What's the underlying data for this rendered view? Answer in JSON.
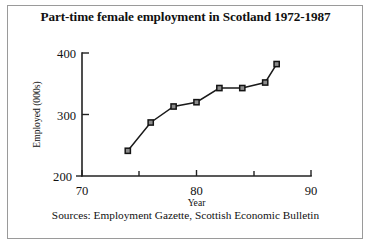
{
  "figure": {
    "title": "Part-time female employment in Scotland 1972-1987",
    "source_note": "Sources: Employment Gazette, Scottish Economic Bulletin",
    "border_color": "#9a9a9a",
    "background": "#ffffff"
  },
  "chart_data": {
    "type": "line",
    "title": "Part-time female employment in Scotland 1972-1987",
    "xlabel": "Year",
    "ylabel": "Employed (000s)",
    "xlim": [
      70,
      90
    ],
    "ylim": [
      200,
      400
    ],
    "xticks": [
      70,
      80,
      90
    ],
    "xtick_labels": [
      "70",
      "80",
      "90"
    ],
    "xminorticks": [
      75,
      80,
      85
    ],
    "yticks": [
      200,
      300,
      400
    ],
    "ytick_labels": [
      "200",
      "300",
      "400"
    ],
    "grid": false,
    "legend": null,
    "marker": "square",
    "line_color": "#1a1a1a",
    "marker_fill": "#8c8c8c",
    "marker_edge": "#141414",
    "x": [
      74,
      76,
      78,
      80,
      82,
      84,
      86,
      87
    ],
    "values": [
      241,
      287,
      313,
      320,
      343,
      343,
      352,
      382
    ],
    "series": [
      {
        "name": "Part-time female employment",
        "x": [
          74,
          76,
          78,
          80,
          82,
          84,
          86,
          87
        ],
        "values": [
          241,
          287,
          313,
          320,
          343,
          343,
          352,
          382
        ]
      }
    ]
  }
}
